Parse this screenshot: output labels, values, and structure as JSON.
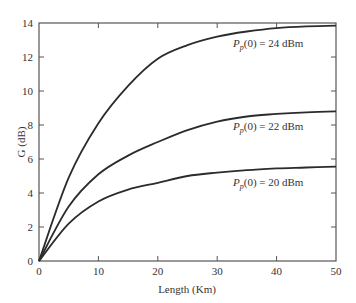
{
  "chart_data": {
    "type": "line",
    "title": "",
    "xlabel": "Length (Km)",
    "ylabel": "G (dB)",
    "xlim": [
      0,
      50
    ],
    "ylim": [
      0,
      14
    ],
    "grid": false,
    "legend_position": "inline annotations",
    "x_ticks": [
      "0",
      "10",
      "20",
      "30",
      "40",
      "50"
    ],
    "y_ticks": [
      "0",
      "2",
      "4",
      "6",
      "8",
      "10",
      "12",
      "14"
    ],
    "x": [
      0,
      5,
      10,
      15,
      20,
      25,
      30,
      35,
      40,
      45,
      50
    ],
    "series": [
      {
        "name": "Pp(0) = 24 dBm",
        "values": [
          0,
          4.9,
          8.1,
          10.3,
          11.9,
          12.7,
          13.2,
          13.5,
          13.7,
          13.8,
          13.85
        ]
      },
      {
        "name": "Pp(0) = 22 dBm",
        "values": [
          0,
          3.2,
          5.1,
          6.2,
          7.0,
          7.7,
          8.2,
          8.5,
          8.65,
          8.75,
          8.8
        ]
      },
      {
        "name": "Pp(0) = 20 dBm",
        "values": [
          0,
          2.2,
          3.5,
          4.2,
          4.6,
          5.0,
          5.2,
          5.35,
          5.45,
          5.5,
          5.55
        ]
      }
    ],
    "annotations": [
      {
        "text_main": "P",
        "text_sub": "p",
        "text_rest": "(0) = 24 dBm",
        "series": 0
      },
      {
        "text_main": "P",
        "text_sub": "p",
        "text_rest": "(0) = 22  dBm",
        "series": 1
      },
      {
        "text_main": "P",
        "text_sub": "p",
        "text_rest": "(0) = 20 dBm",
        "series": 2
      }
    ]
  }
}
